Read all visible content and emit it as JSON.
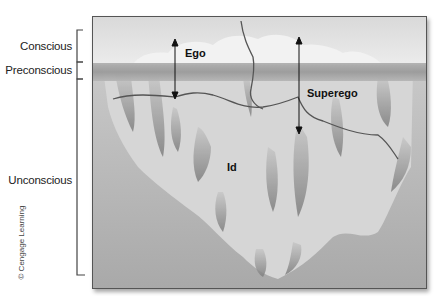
{
  "levels": [
    {
      "label": "Conscious"
    },
    {
      "label": "Preconscious"
    },
    {
      "label": "Unconscious"
    }
  ],
  "structures": {
    "ego": "Ego",
    "superego": "Superego",
    "id": "Id"
  },
  "credit": "© Cengage Learning",
  "colors": {
    "sky": "#e6e6e6",
    "waterline": "#9a9a9a",
    "water": "#b8b8b8",
    "iceberg": "#dadada",
    "iceberg_shadow": "#8c8c8c",
    "lines": "#555555"
  }
}
